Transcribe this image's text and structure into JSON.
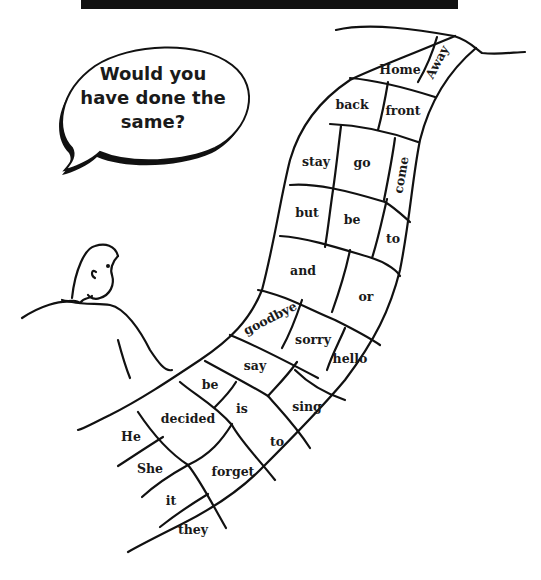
{
  "banner": {
    "color": "#111111"
  },
  "speech_bubble": {
    "lines": [
      "Would you",
      "have done the",
      "same?"
    ]
  },
  "path": {
    "squares": [
      {
        "word": "Away",
        "x": 437,
        "y": 62,
        "rotate": -62
      },
      {
        "word": "Home",
        "x": 400,
        "y": 69,
        "rotate": 0
      },
      {
        "word": "back",
        "x": 352,
        "y": 104,
        "rotate": 0
      },
      {
        "word": "front",
        "x": 403,
        "y": 110,
        "rotate": 0
      },
      {
        "word": "stay",
        "x": 316,
        "y": 161,
        "rotate": 0
      },
      {
        "word": "go",
        "x": 362,
        "y": 162,
        "rotate": 0
      },
      {
        "word": "come",
        "x": 401,
        "y": 175,
        "rotate": -80
      },
      {
        "word": "but",
        "x": 307,
        "y": 212,
        "rotate": 0
      },
      {
        "word": "be",
        "x": 352,
        "y": 219,
        "rotate": 0
      },
      {
        "word": "to",
        "x": 393,
        "y": 238,
        "rotate": 0
      },
      {
        "word": "and",
        "x": 303,
        "y": 270,
        "rotate": 0
      },
      {
        "word": "or",
        "x": 366,
        "y": 296,
        "rotate": 0
      },
      {
        "word": "goodbye",
        "x": 270,
        "y": 318,
        "rotate": -27
      },
      {
        "word": "sorry",
        "x": 313,
        "y": 339,
        "rotate": 0
      },
      {
        "word": "hello",
        "x": 350,
        "y": 358,
        "rotate": 0
      },
      {
        "word": "say",
        "x": 255,
        "y": 365,
        "rotate": 0
      },
      {
        "word": "be",
        "x": 210,
        "y": 384,
        "rotate": 0
      },
      {
        "word": "is",
        "x": 242,
        "y": 408,
        "rotate": 0
      },
      {
        "word": "sing",
        "x": 307,
        "y": 406,
        "rotate": 0
      },
      {
        "word": "decided",
        "x": 188,
        "y": 418,
        "rotate": 0
      },
      {
        "word": "He",
        "x": 131,
        "y": 436,
        "rotate": 0
      },
      {
        "word": "to",
        "x": 277,
        "y": 441,
        "rotate": 0
      },
      {
        "word": "She",
        "x": 150,
        "y": 468,
        "rotate": 0
      },
      {
        "word": "forget",
        "x": 233,
        "y": 471,
        "rotate": 0
      },
      {
        "word": "it",
        "x": 171,
        "y": 500,
        "rotate": 0
      },
      {
        "word": "they",
        "x": 193,
        "y": 529,
        "rotate": 0
      }
    ]
  },
  "character": {
    "description": "boy-looking-at-path"
  }
}
